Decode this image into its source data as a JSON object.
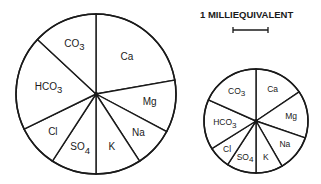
{
  "chart_data": {
    "type": "pie",
    "title": "",
    "legend": {
      "scale_label": "1 MILLIEQUIVALENT",
      "scale_bar_px": 35
    },
    "units": "milliequivalents (segment angles in degrees)",
    "charts": [
      {
        "name": "large-pie",
        "center": [
          96,
          94
        ],
        "radius": 80,
        "label_size": 10,
        "segments": [
          {
            "label": "Ca",
            "sub": "",
            "start": 0,
            "end": 80,
            "label_r": 0.6
          },
          {
            "label": "Mg",
            "sub": "",
            "start": 80,
            "end": 118,
            "label_r": 0.68
          },
          {
            "label": "Na",
            "sub": "",
            "start": 118,
            "end": 147,
            "label_r": 0.72
          },
          {
            "label": "K",
            "sub": "",
            "start": 147,
            "end": 180,
            "label_r": 0.7
          },
          {
            "label": "SO",
            "sub": "4",
            "start": 180,
            "end": 213,
            "label_r": 0.7
          },
          {
            "label": "Cl",
            "sub": "",
            "start": 213,
            "end": 244,
            "label_r": 0.72
          },
          {
            "label": "HCO",
            "sub": "3",
            "start": 244,
            "end": 313,
            "label_r": 0.6
          },
          {
            "label": "CO",
            "sub": "3",
            "start": 313,
            "end": 360,
            "label_r": 0.68
          }
        ]
      },
      {
        "name": "small-pie",
        "center": [
          256,
          121
        ],
        "radius": 52,
        "label_size": 8.5,
        "segments": [
          {
            "label": "Ca",
            "sub": "",
            "start": 0,
            "end": 56,
            "label_r": 0.68
          },
          {
            "label": "Mg",
            "sub": "",
            "start": 56,
            "end": 109,
            "label_r": 0.68
          },
          {
            "label": "Na",
            "sub": "",
            "start": 109,
            "end": 150,
            "label_r": 0.72
          },
          {
            "label": "K",
            "sub": "",
            "start": 150,
            "end": 180,
            "label_r": 0.74
          },
          {
            "label": "SO",
            "sub": "4",
            "start": 180,
            "end": 213,
            "label_r": 0.74
          },
          {
            "label": "Cl",
            "sub": "",
            "start": 213,
            "end": 238,
            "label_r": 0.78
          },
          {
            "label": "HCO",
            "sub": "3",
            "start": 238,
            "end": 294,
            "label_r": 0.6
          },
          {
            "label": "CO",
            "sub": "3",
            "start": 294,
            "end": 360,
            "label_r": 0.68
          }
        ]
      }
    ]
  }
}
